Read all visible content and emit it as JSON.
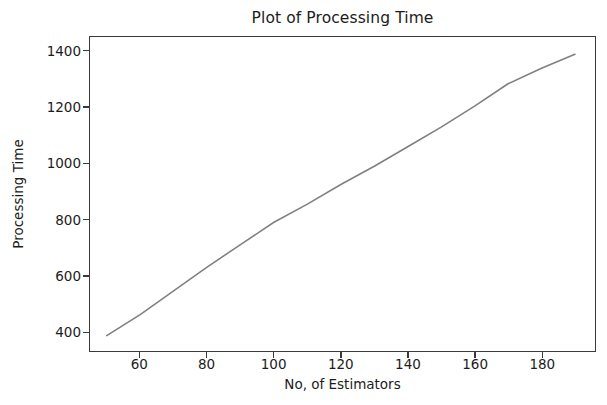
{
  "figure": {
    "background_color": "#ffffff",
    "axes_color": "#3a3a3a",
    "text_color": "#1c1c1c"
  },
  "chart_data": {
    "type": "line",
    "title": "Plot of Processing Time",
    "xlabel": "No, of Estimators",
    "ylabel": "Processing Time",
    "xlim": [
      45,
      196
    ],
    "ylim": [
      330,
      1452
    ],
    "xticks": [
      60,
      80,
      100,
      120,
      140,
      160,
      180
    ],
    "xtick_labels": [
      "60",
      "80",
      "100",
      "120",
      "140",
      "160",
      "180"
    ],
    "yticks": [
      400,
      600,
      800,
      1000,
      1200,
      1400
    ],
    "ytick_labels": [
      "400",
      "600",
      "800",
      "1000",
      "1200",
      "1400"
    ],
    "grid": false,
    "legend": false,
    "series": [
      {
        "name": "Processing Time",
        "color": "#808080",
        "linewidth": 1.5,
        "marker": "none",
        "x": [
          50,
          60,
          70,
          80,
          90,
          100,
          110,
          120,
          130,
          140,
          150,
          160,
          170,
          180,
          190
        ],
        "y": [
          385,
          460,
          545,
          630,
          710,
          790,
          855,
          925,
          990,
          1060,
          1130,
          1205,
          1285,
          1340,
          1390
        ]
      }
    ]
  }
}
